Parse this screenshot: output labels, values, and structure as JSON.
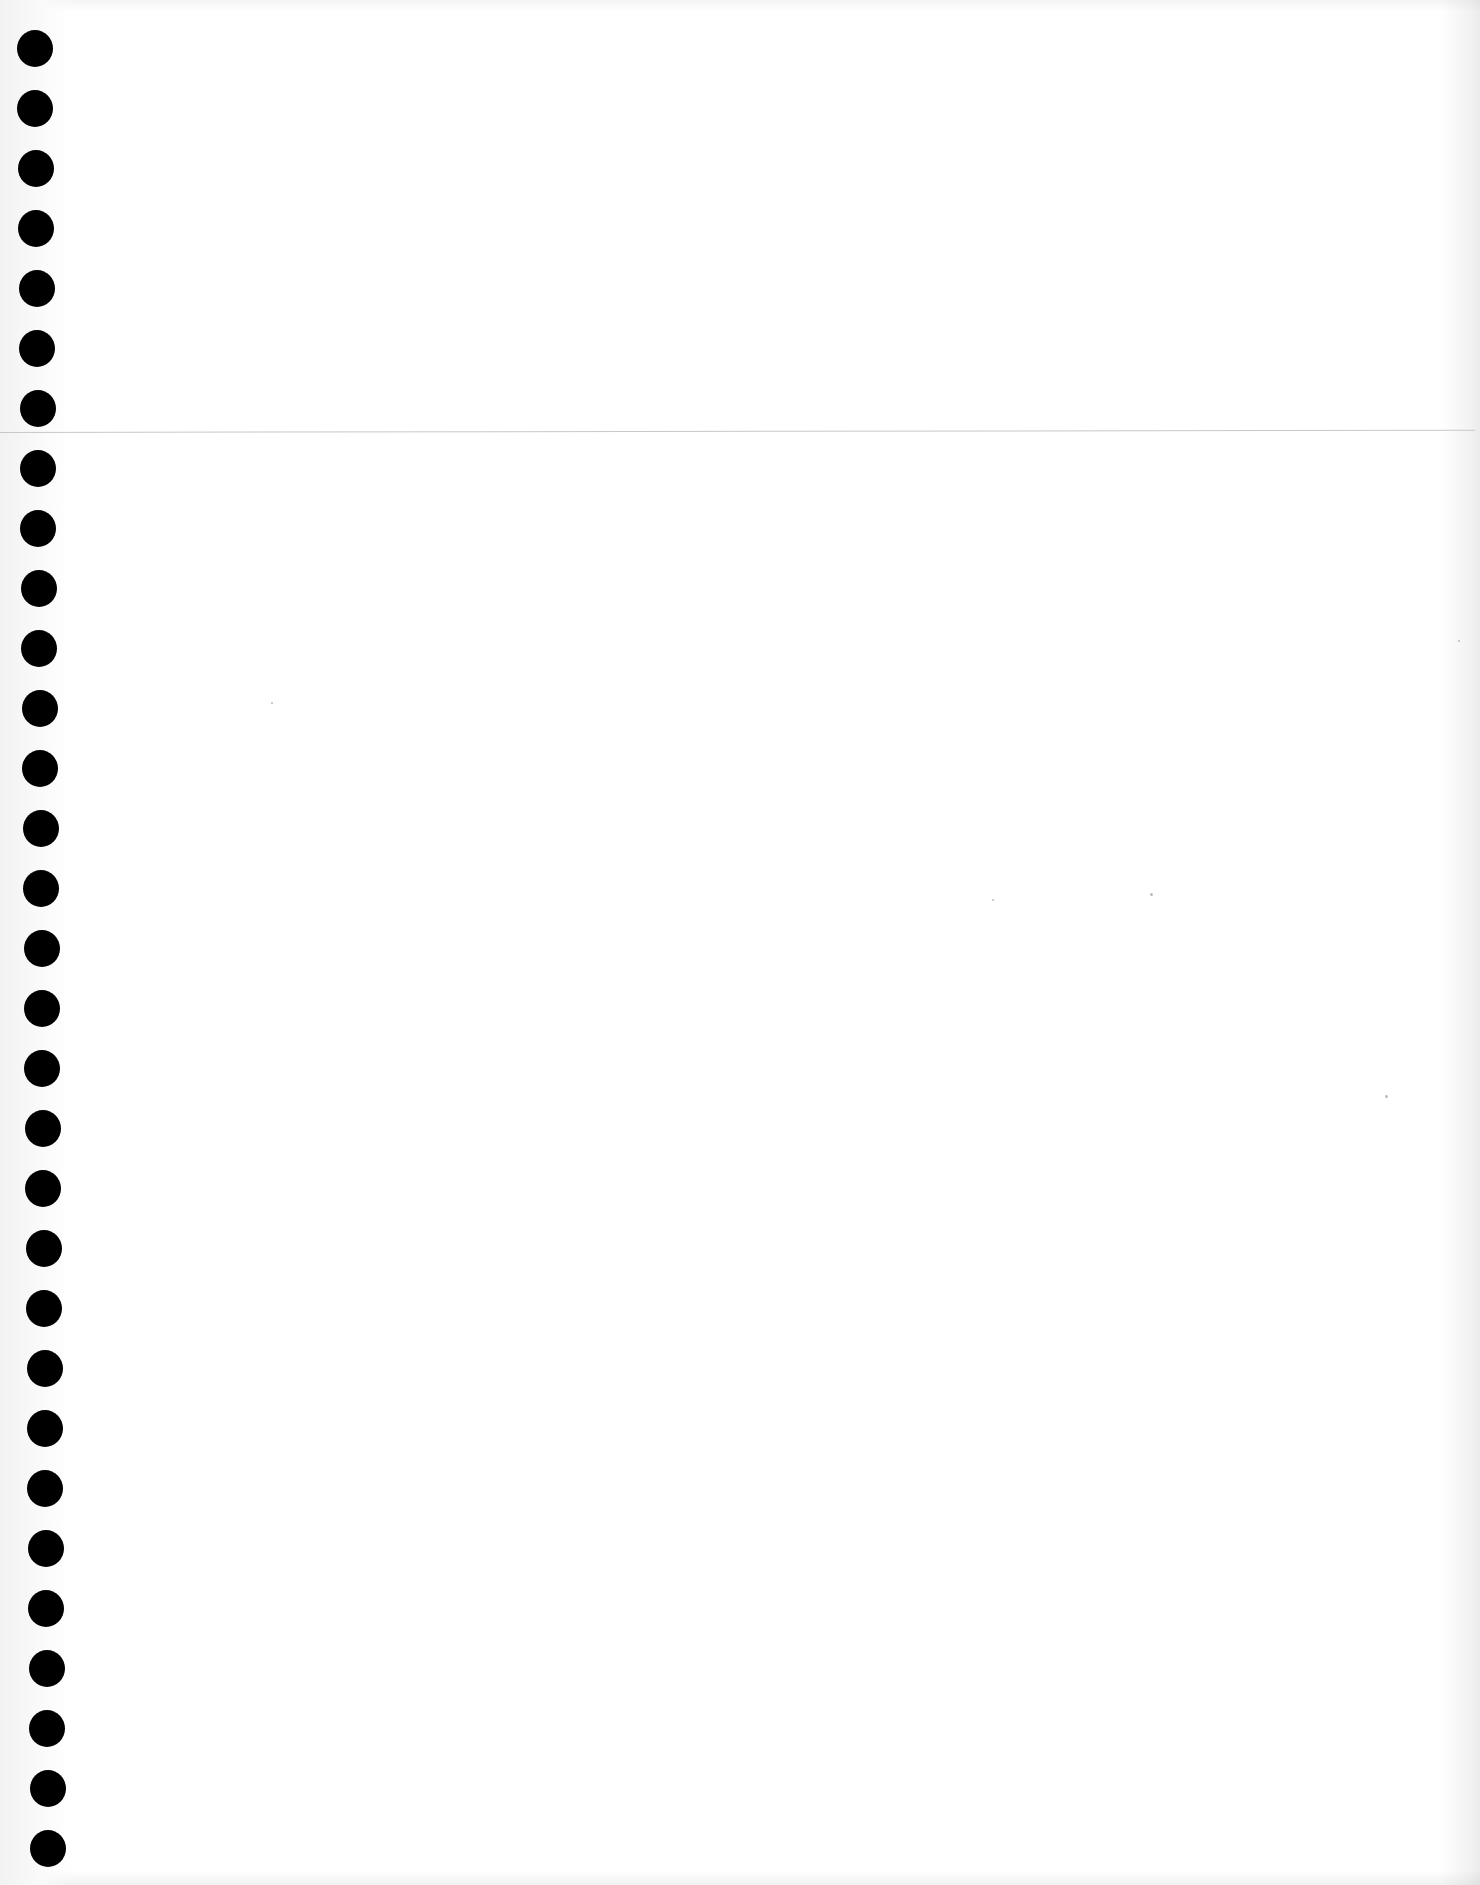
{
  "document": {
    "type": "blank-notebook-page",
    "text": "",
    "hole_count": 31,
    "hole_spacing_px": 60,
    "rule_lines": 1,
    "colors": {
      "paper": "#ffffff",
      "holes": "#000000",
      "rule": "#c8c8c8"
    }
  }
}
